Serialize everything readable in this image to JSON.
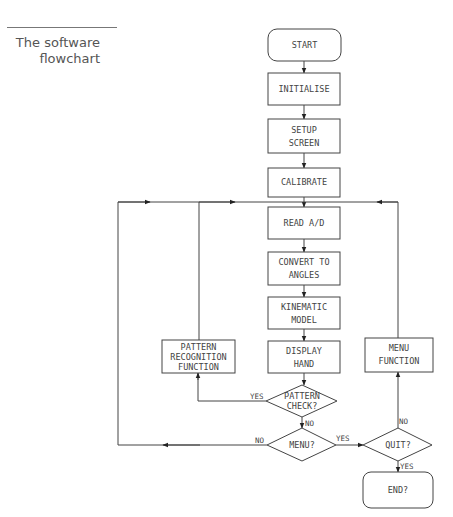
{
  "caption": {
    "line1": "The software",
    "line2": "flowchart"
  },
  "nodes": {
    "start": {
      "type": "terminal",
      "lines": [
        "START"
      ]
    },
    "initialise": {
      "type": "process",
      "lines": [
        "INITIALISE"
      ]
    },
    "setup_screen": {
      "type": "process",
      "lines": [
        "SETUP",
        "SCREEN"
      ]
    },
    "calibrate": {
      "type": "process",
      "lines": [
        "CALIBRATE"
      ]
    },
    "read_ad": {
      "type": "process",
      "lines": [
        "READ A/D"
      ]
    },
    "convert": {
      "type": "process",
      "lines": [
        "CONVERT TO",
        "ANGLES"
      ]
    },
    "kinematic": {
      "type": "process",
      "lines": [
        "KINEMATIC",
        "MODEL"
      ]
    },
    "display": {
      "type": "process",
      "lines": [
        "DISPLAY",
        "HAND"
      ]
    },
    "pattern_recognition": {
      "type": "process",
      "lines": [
        "PATTERN",
        "RECOGNITION",
        "FUNCTION"
      ]
    },
    "pattern_check": {
      "type": "decision",
      "lines": [
        "PATTERN",
        "CHECK?"
      ]
    },
    "menu": {
      "type": "decision",
      "lines": [
        "MENU?"
      ]
    },
    "quit": {
      "type": "decision",
      "lines": [
        "QUIT?"
      ]
    },
    "menu_function": {
      "type": "process",
      "lines": [
        "MENU",
        "FUNCTION"
      ]
    },
    "end": {
      "type": "terminal",
      "lines": [
        "END?"
      ]
    }
  },
  "edge_labels": {
    "pattern_yes": "YES",
    "pattern_no": "NO",
    "menu_no": "NO",
    "menu_yes": "YES",
    "quit_no": "NO",
    "quit_yes": "YES"
  }
}
